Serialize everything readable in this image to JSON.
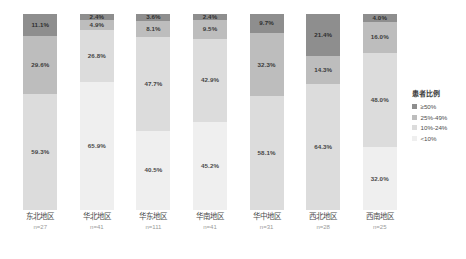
{
  "chart_data": {
    "type": "bar",
    "title": "",
    "subtitle": "",
    "xlabel": "",
    "ylabel": "",
    "ylim": [
      0,
      100
    ],
    "grid": false,
    "stacked": true,
    "normalized_percent": true,
    "legend_position": "right",
    "legend_title": "患者比例",
    "categories": [
      "东北地区",
      "华北地区",
      "华东地区",
      "华南地区",
      "华中地区",
      "西北地区",
      "西南地区"
    ],
    "category_counts": [
      "n=27",
      "n=41",
      "n=111",
      "n=41",
      "n=31",
      "n=28",
      "n=25"
    ],
    "series": [
      {
        "name": "≥50%",
        "color": "#8e8e8e",
        "values": [
          11.1,
          2.4,
          3.6,
          2.4,
          9.7,
          21.4,
          4.0
        ],
        "labels": [
          "11.1%",
          "2.4%",
          "3.6%",
          "2.4%",
          "9.7%",
          "21.4%",
          "4.0%"
        ]
      },
      {
        "name": "25%-49%",
        "color": "#bdbdbd",
        "values": [
          29.6,
          4.9,
          8.1,
          9.5,
          32.3,
          14.3,
          16.0
        ],
        "labels": [
          "29.6%",
          "4.9%",
          "8.1%",
          "9.5%",
          "32.3%",
          "14.3%",
          "16.0%"
        ]
      },
      {
        "name": "10%-24%",
        "color": "#dcdcdc",
        "values": [
          59.3,
          26.8,
          47.7,
          42.9,
          58.1,
          64.3,
          48.0
        ],
        "labels": [
          "59.3%",
          "26.8%",
          "47.7%",
          "42.9%",
          "58.1%",
          "64.3%",
          "48.0%"
        ]
      },
      {
        "name": "<10%",
        "color": "#efefef",
        "values": [
          0,
          65.9,
          40.5,
          45.2,
          0,
          0,
          32.0
        ],
        "labels": [
          "",
          "65.9%",
          "40.5%",
          "45.2%",
          "",
          "",
          "32.0%"
        ]
      }
    ]
  },
  "legend": {
    "title": "患者比例",
    "items": [
      {
        "label": "≥50%",
        "color": "#8e8e8e"
      },
      {
        "label": "25%-49%",
        "color": "#bdbdbd"
      },
      {
        "label": "10%-24%",
        "color": "#dcdcdc"
      },
      {
        "label": "<10%",
        "color": "#efefef"
      }
    ]
  }
}
